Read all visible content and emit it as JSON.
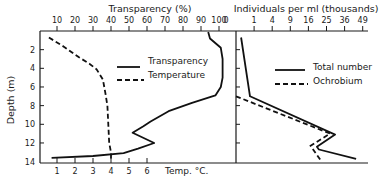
{
  "chart_data": [
    {
      "type": "line",
      "panel": "left",
      "title": "Transparency (%)",
      "ylabel": "Depth (m)",
      "xlabel_top": "Transparency (%)",
      "xlabel_bottom": "Temp. °C.",
      "y_ticks": [
        "2",
        "4",
        "6",
        "8",
        "10",
        "12",
        "14"
      ],
      "y_tick_values": [
        2,
        4,
        6,
        8,
        10,
        12,
        14
      ],
      "ylim": [
        0,
        14
      ],
      "y_inverted": true,
      "x_top_ticks": [
        "10",
        "20",
        "30",
        "40",
        "50",
        "60",
        "70",
        "80",
        "90",
        "100"
      ],
      "x_top_tick_values": [
        10,
        20,
        30,
        40,
        50,
        60,
        70,
        80,
        90,
        100
      ],
      "x_top_lim": [
        0,
        110
      ],
      "x_bottom_ticks": [
        "1",
        "2",
        "3",
        "4",
        "5",
        "6"
      ],
      "x_bottom_tick_values": [
        1,
        2,
        3,
        4,
        5,
        6
      ],
      "x_bottom_lim": [
        0,
        11
      ],
      "legend": [
        {
          "name": "Transparency",
          "style": "solid"
        },
        {
          "name": "Temperature",
          "style": "dashed"
        }
      ],
      "series": [
        {
          "name": "Transparency",
          "axis": "top",
          "style": "solid",
          "points": [
            [
              94,
              0.1
            ],
            [
              95,
              0.8
            ],
            [
              101,
              1.8
            ],
            [
              102,
              3.0
            ],
            [
              102,
              5.0
            ],
            [
              101,
              6.0
            ],
            [
              98,
              6.9
            ],
            [
              85,
              7.7
            ],
            [
              72,
              8.6
            ],
            [
              62,
              9.7
            ],
            [
              58,
              10.2
            ],
            [
              52,
              10.9
            ],
            [
              64,
              12.0
            ],
            [
              55,
              12.6
            ],
            [
              47,
              13.1
            ],
            [
              30,
              13.4
            ],
            [
              7,
              13.6
            ]
          ]
        },
        {
          "name": "Temperature",
          "axis": "bottom",
          "style": "dashed",
          "points": [
            [
              0.55,
              0.7
            ],
            [
              1.4,
              1.7
            ],
            [
              2.2,
              2.8
            ],
            [
              2.8,
              3.5
            ],
            [
              3.2,
              4.1
            ],
            [
              3.55,
              5.2
            ],
            [
              3.7,
              6.8
            ],
            [
              3.8,
              8.0
            ],
            [
              3.85,
              10.0
            ],
            [
              3.9,
              12.0
            ],
            [
              4.0,
              13.0
            ],
            [
              4.0,
              14.0
            ]
          ]
        }
      ]
    },
    {
      "type": "line",
      "panel": "right",
      "title": "Individuals per ml (thousands)",
      "x_scale": "sqrt",
      "x_top_ticks": [
        "0",
        "1",
        "4",
        "9",
        "16",
        "25",
        "36",
        "49"
      ],
      "x_top_tick_values": [
        0,
        1,
        4,
        9,
        16,
        25,
        36,
        49
      ],
      "xlim": [
        0,
        52
      ],
      "ylim": [
        0,
        14
      ],
      "y_inverted": true,
      "legend": [
        {
          "name": "Total number",
          "style": "solid"
        },
        {
          "name": "Ochrobium",
          "style": "dashed"
        }
      ],
      "series": [
        {
          "name": "Total number",
          "style": "solid",
          "points": [
            [
              0.08,
              0.7
            ],
            [
              0.6,
              7.0
            ],
            [
              30,
              11.1
            ],
            [
              20,
              12.4
            ],
            [
              21,
              12.7
            ],
            [
              44,
              13.7
            ]
          ]
        },
        {
          "name": "Ochrobium",
          "style": "dashed",
          "points": [
            [
              0,
              7.0
            ],
            [
              27,
              11.0
            ],
            [
              17,
              12.3
            ],
            [
              22,
              13.9
            ]
          ]
        }
      ]
    }
  ]
}
